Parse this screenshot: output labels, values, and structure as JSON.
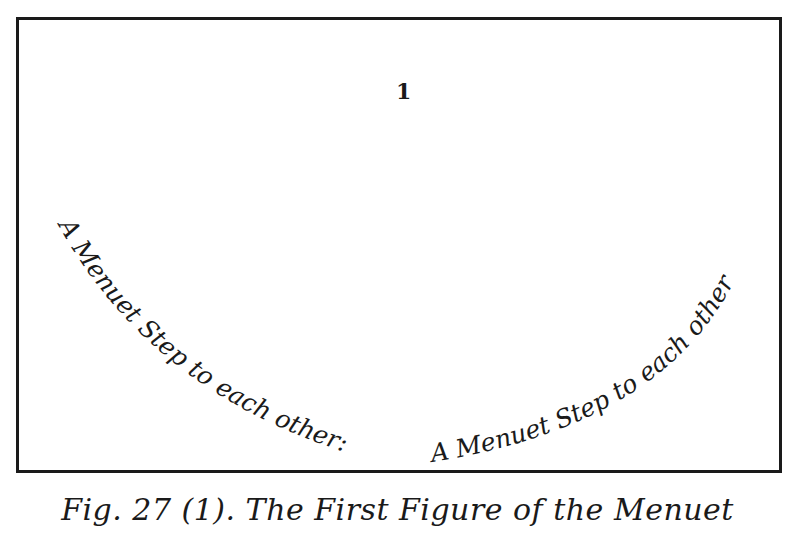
{
  "figure": {
    "number_label": "1",
    "left_path_text": "A Menuet Step to each other:",
    "right_path_text": "A Menuet Step to each other",
    "caption": "Fig. 27 (1). The First Figure of the Menuet"
  }
}
